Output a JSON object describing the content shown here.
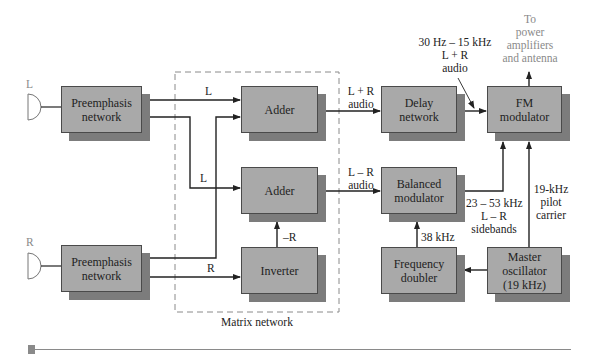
{
  "diagram": {
    "type": "block diagram"
  },
  "inputs": {
    "left": "L",
    "right": "R"
  },
  "blocks": {
    "preemph_l": "Preemphasis network",
    "preemph_r": "Preemphasis network",
    "adder_sum": "Adder",
    "adder_diff": "Adder",
    "inverter": "Inverter",
    "delay": "Delay network",
    "balanced": "Balanced modulator",
    "doubler": "Frequency doubler",
    "fm_mod": "FM modulator",
    "master_osc": "Master oscillator (19 kHz)"
  },
  "block_lines": {
    "preemph_l": [
      "Preemphasis",
      "network"
    ],
    "preemph_r": [
      "Preemphasis",
      "network"
    ],
    "delay": [
      "Delay",
      "network"
    ],
    "balanced": [
      "Balanced",
      "modulator"
    ],
    "doubler": [
      "Frequency",
      "doubler"
    ],
    "fm_mod": [
      "FM",
      "modulator"
    ],
    "master_osc": [
      "Master",
      "oscillator",
      "(19 kHz)"
    ]
  },
  "labels": {
    "l_to_adder1": "L",
    "l_to_adder2": "L",
    "r_to_inverter": "R",
    "neg_r": "–R",
    "lpr_audio": [
      "L + R",
      "audio"
    ],
    "lmr_audio": [
      "L – R",
      "audio"
    ],
    "delay_out": [
      "30 Hz – 15 kHz",
      "L + R",
      "audio"
    ],
    "output": [
      "To",
      "power",
      "amplifiers",
      "and antenna"
    ],
    "sidebands": [
      "23 – 53 kHz",
      "L – R",
      "sidebands"
    ],
    "pilot": [
      "19-kHz",
      "pilot",
      "carrier"
    ],
    "freq_38": "38 kHz",
    "matrix": "Matrix network"
  },
  "colors": {
    "block_face": "#a9a9a9",
    "block_shadow": "#7c7c7c",
    "line": "#222222",
    "muted_text": "#8a8a8a",
    "dashed_border": "#8a8a8a"
  }
}
